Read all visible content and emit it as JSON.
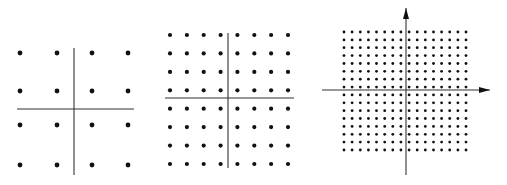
{
  "figure": {
    "background_color": "#ffffff",
    "ink_color": "#111111",
    "axis_color": "#333333",
    "panels": [
      {
        "id": "panel-4x4",
        "grid_size": 4,
        "total_points": 16,
        "x_positions": [
          20,
          57,
          92,
          128
        ],
        "y_positions": [
          53,
          91,
          125,
          165
        ],
        "dot_radius": 2.4,
        "axes": {
          "h": {
            "x1": 17,
            "x2": 134,
            "y": 109
          },
          "v": {
            "x": 74,
            "y1": 48,
            "y2": 175
          },
          "arrows": false
        }
      },
      {
        "id": "panel-8x8",
        "grid_size": 8,
        "total_points": 64,
        "x_start": 170,
        "x_end": 288,
        "y_start": 35,
        "y_end": 164,
        "dot_radius": 2.1,
        "axes": {
          "h": {
            "x1": 165,
            "x2": 294,
            "y": 98
          },
          "v": {
            "x": 228,
            "y1": 33,
            "y2": 168
          },
          "arrows": false
        }
      },
      {
        "id": "panel-16x16",
        "grid_size": 16,
        "total_points": 256,
        "x_start": 344,
        "x_end": 466,
        "y_start": 32,
        "y_end": 150,
        "dot_radius": 1.4,
        "axes": {
          "h": {
            "x1": 322,
            "x2": 490,
            "y": 90
          },
          "v": {
            "x": 406,
            "y1": 175,
            "y2": 8
          },
          "arrows": true
        }
      }
    ]
  }
}
